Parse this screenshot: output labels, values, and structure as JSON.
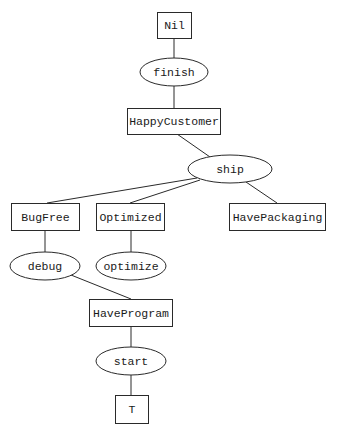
{
  "diagram": {
    "type": "plan-graph",
    "nodes": {
      "nil": {
        "label": "Nil",
        "kind": "state"
      },
      "finish": {
        "label": "finish",
        "kind": "action"
      },
      "happy_customer": {
        "label": "HappyCustomer",
        "kind": "state"
      },
      "ship": {
        "label": "ship",
        "kind": "action"
      },
      "bug_free": {
        "label": "BugFree",
        "kind": "state"
      },
      "optimized": {
        "label": "Optimized",
        "kind": "state"
      },
      "have_packaging": {
        "label": "HavePackaging",
        "kind": "state"
      },
      "debug": {
        "label": "debug",
        "kind": "action"
      },
      "optimize": {
        "label": "optimize",
        "kind": "action"
      },
      "have_program": {
        "label": "HaveProgram",
        "kind": "state"
      },
      "start": {
        "label": "start",
        "kind": "action"
      },
      "t": {
        "label": "T",
        "kind": "state"
      }
    },
    "edges": [
      {
        "from": "Nil",
        "to": "finish"
      },
      {
        "from": "finish",
        "to": "HappyCustomer"
      },
      {
        "from": "HappyCustomer",
        "to": "ship"
      },
      {
        "from": "ship",
        "to": "BugFree"
      },
      {
        "from": "ship",
        "to": "Optimized"
      },
      {
        "from": "ship",
        "to": "HavePackaging"
      },
      {
        "from": "BugFree",
        "to": "debug"
      },
      {
        "from": "Optimized",
        "to": "optimize"
      },
      {
        "from": "debug",
        "to": "HaveProgram"
      },
      {
        "from": "HaveProgram",
        "to": "start"
      },
      {
        "from": "start",
        "to": "T"
      }
    ]
  }
}
